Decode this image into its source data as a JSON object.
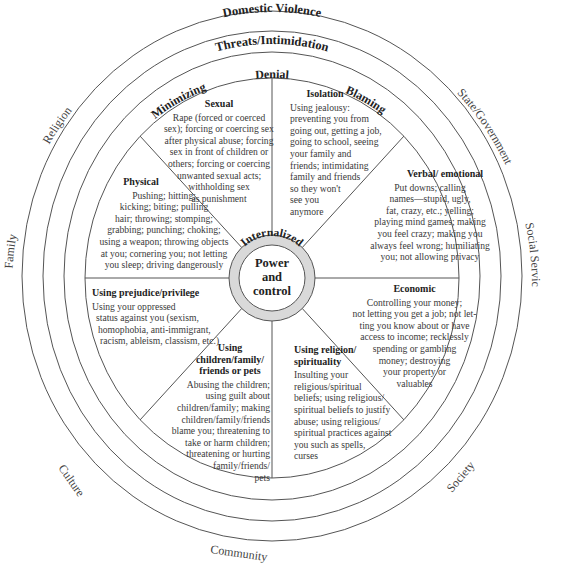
{
  "center": {
    "line1": "Power",
    "line2": "and",
    "line3": "control"
  },
  "internal_ring": {
    "label": "Internalized"
  },
  "rings": {
    "innermost_labels": [
      "Minimizing",
      "Denial",
      "Blaming"
    ],
    "middle_label": "Threats/Intimidation",
    "outer_label": "Domestic Violence"
  },
  "outside_labels": [
    "Religion",
    "State/Government",
    "Family",
    "Social Services",
    "Culture",
    "Society",
    "Community"
  ],
  "segments": [
    {
      "id": "sexual",
      "title": "Sexual",
      "lines": [
        "Rape (forced or coerced",
        "sex); forcing or coercing sex",
        "after physical abuse; forcing",
        "sex in front of children or",
        "others; forcing or coercing",
        "unwanted sexual acts;",
        "withholding sex",
        "as punishment"
      ]
    },
    {
      "id": "isolation",
      "title": "Isolation",
      "lines": [
        "Using jealousy:",
        "preventing you from",
        "going out, getting a job,",
        "going to school, seeing",
        "your family and",
        "friends; intimidating",
        "family and friends",
        "so they won't",
        "see you",
        "anymore"
      ]
    },
    {
      "id": "verbal",
      "title": "Verbal/ emotional",
      "lines": [
        "Put downs; calling",
        "names—stupid, ugly,",
        "fat, crazy, etc.; yelling;",
        "playing mind games; making",
        "you feel crazy; making you",
        "always feel wrong; humiliating",
        "you; not allowing privacy"
      ]
    },
    {
      "id": "economic",
      "title": "Economic",
      "lines": [
        "Controlling your money;",
        "not letting you get a job; not let-",
        "ting you know about or have",
        "access to income; recklessly",
        "spending or gambling",
        "money; destroying",
        "your property or",
        "valuables"
      ]
    },
    {
      "id": "religion",
      "title": "Using religion/ spirituality",
      "lines": [
        "Insulting your",
        "religious/spiritual",
        "beliefs; using religious/",
        "spiritual beliefs to justify",
        "abuse; using religious/",
        "spiritual practices against",
        "you such as spells,",
        "curses"
      ]
    },
    {
      "id": "children",
      "title": "Using children/family/ friends or pets",
      "lines": [
        "Abusing the children;",
        "using guilt about",
        "children/family; making",
        "children/family/friends",
        "blame you; threatening to",
        "take or harm children;",
        "threatening or hurting",
        "family/friends/",
        "pets"
      ]
    },
    {
      "id": "prejudice",
      "title": "Using prejudice/privilege",
      "lines": [
        "Using your oppressed",
        "status against you (sexism,",
        "homophobia, anti-immigrant,",
        "racism, ableism, classism, etc.)"
      ]
    },
    {
      "id": "physical",
      "title": "Physical",
      "lines": [
        "Pushing; hitting;",
        "kicking; biting; pulling",
        "hair; throwing; stomping;",
        "grabbing; punching; choking;",
        "using a weapon; throwing objects",
        "at you; cornering you; not letting",
        "you sleep; driving dangerously"
      ]
    }
  ],
  "colors": {
    "line": "#555555",
    "inner_ring_fill": "#d9d9d9",
    "text": "#333333"
  }
}
